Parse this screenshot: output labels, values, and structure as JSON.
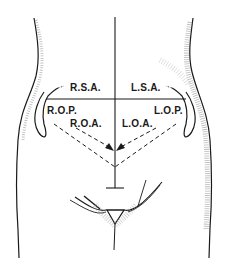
{
  "diagram": {
    "labels": {
      "rsa": "R.S.A.",
      "lsa": "L.S.A.",
      "rop": "R.O.P.",
      "lop": "L.O.P.",
      "roa": "R.O.A.",
      "loa": "L.O.A."
    },
    "colors": {
      "ink": "#1a1a1a",
      "shade": "#8a8a8a",
      "background": "#ffffff"
    }
  }
}
